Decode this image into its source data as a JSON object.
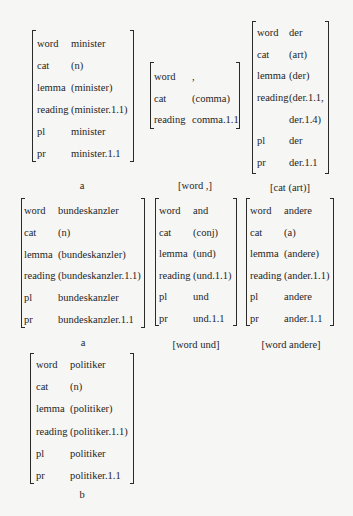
{
  "matrices": [
    {
      "id": "minister",
      "rows": [
        {
          "feature": "word",
          "value": "minister"
        },
        {
          "feature": "cat",
          "value": "(n)"
        },
        {
          "feature": "lemma",
          "value": "(minister)"
        },
        {
          "feature": "reading",
          "value": "(minister.1.1)"
        },
        {
          "feature": "pl",
          "value": "minister"
        },
        {
          "feature": "pr",
          "value": "minister.1.1"
        }
      ],
      "caption": "a"
    },
    {
      "id": "comma",
      "rows": [
        {
          "feature": "word",
          "value": ","
        },
        {
          "feature": "cat",
          "value": "(comma)"
        },
        {
          "feature": "reading",
          "value": "comma.1.1"
        }
      ],
      "caption": "[word ,]"
    },
    {
      "id": "der",
      "rows": [
        {
          "feature": "word",
          "value": "der"
        },
        {
          "feature": "cat",
          "value": "(art)"
        },
        {
          "feature": "lemma",
          "value": "(der)"
        },
        {
          "feature": "reading",
          "value": "(der.1.1,"
        },
        {
          "feature": "",
          "value": "der.1.4)"
        },
        {
          "feature": "pl",
          "value": "der"
        },
        {
          "feature": "pr",
          "value": "der.1.1"
        }
      ],
      "caption": "[cat (art)]"
    },
    {
      "id": "bundeskanzler",
      "rows": [
        {
          "feature": "word",
          "value": "bundeskanzler"
        },
        {
          "feature": "cat",
          "value": "(n)"
        },
        {
          "feature": "lemma",
          "value": "(bundeskanzler)"
        },
        {
          "feature": "reading",
          "value": "(bundeskanzler.1.1)"
        },
        {
          "feature": "pl",
          "value": "bundeskanzler"
        },
        {
          "feature": "pr",
          "value": "bundeskanzler.1.1"
        }
      ],
      "caption": "a"
    },
    {
      "id": "und",
      "rows": [
        {
          "feature": "word",
          "value": "and"
        },
        {
          "feature": "cat",
          "value": "(conj)"
        },
        {
          "feature": "lemma",
          "value": "(und)"
        },
        {
          "feature": "reading",
          "value": "(und.1.1)"
        },
        {
          "feature": "pl",
          "value": "und"
        },
        {
          "feature": "pr",
          "value": "und.1.1"
        }
      ],
      "caption": "[word und]"
    },
    {
      "id": "andere",
      "rows": [
        {
          "feature": "word",
          "value": "andere"
        },
        {
          "feature": "cat",
          "value": "(a)"
        },
        {
          "feature": "lemma",
          "value": "(andere)"
        },
        {
          "feature": "reading",
          "value": "(ander.1.1)"
        },
        {
          "feature": "pl",
          "value": "andere"
        },
        {
          "feature": "pr",
          "value": "ander.1.1"
        }
      ],
      "caption": "[word andere]"
    },
    {
      "id": "politiker",
      "rows": [
        {
          "feature": "word",
          "value": "politiker"
        },
        {
          "feature": "cat",
          "value": "(n)"
        },
        {
          "feature": "lemma",
          "value": "(politiker)"
        },
        {
          "feature": "reading",
          "value": "(politiker.1.1)"
        },
        {
          "feature": "pl",
          "value": "politiker"
        },
        {
          "feature": "pr",
          "value": "politiker.1.1"
        }
      ],
      "caption": "b"
    }
  ]
}
